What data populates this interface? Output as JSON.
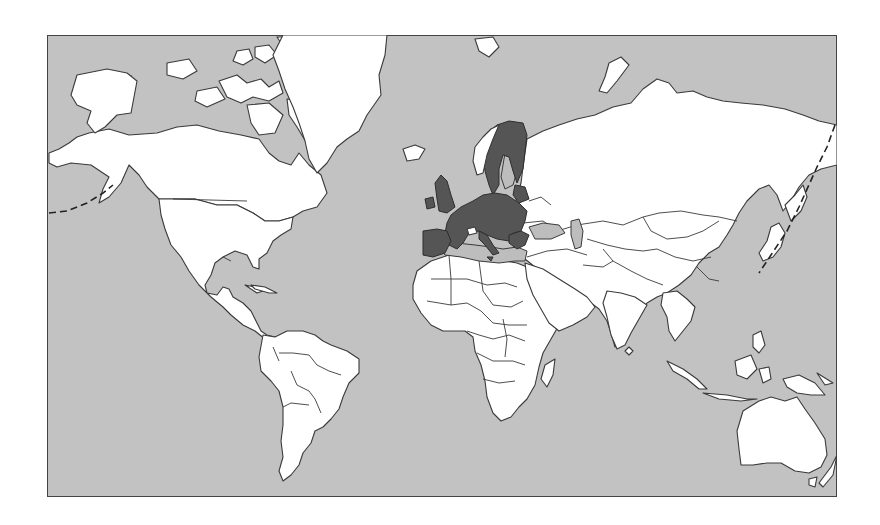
{
  "map": {
    "projection": "Mercator",
    "colors": {
      "ocean": "#c2c2c2",
      "land": "#ffffff",
      "highlight": "#555555",
      "outline": "#3a3a3a",
      "frame": "#444444",
      "page_background": "#ffffff"
    },
    "highlighted_region": "European Union member states",
    "highlighted_countries": [
      "Ireland",
      "United Kingdom",
      "Portugal",
      "Spain",
      "France",
      "Belgium",
      "Netherlands",
      "Luxembourg",
      "Germany",
      "Denmark",
      "Sweden",
      "Finland",
      "Estonia",
      "Latvia",
      "Lithuania",
      "Poland",
      "Czech Republic",
      "Slovakia",
      "Austria",
      "Hungary",
      "Slovenia",
      "Italy",
      "Romania",
      "Bulgaria",
      "Greece",
      "Malta",
      "Cyprus"
    ],
    "non_highlighted_examples": [
      "Norway",
      "Switzerland",
      "Iceland",
      "Russia"
    ],
    "features": [
      "international-date-line-dashes",
      "country-borders",
      "frame"
    ]
  }
}
